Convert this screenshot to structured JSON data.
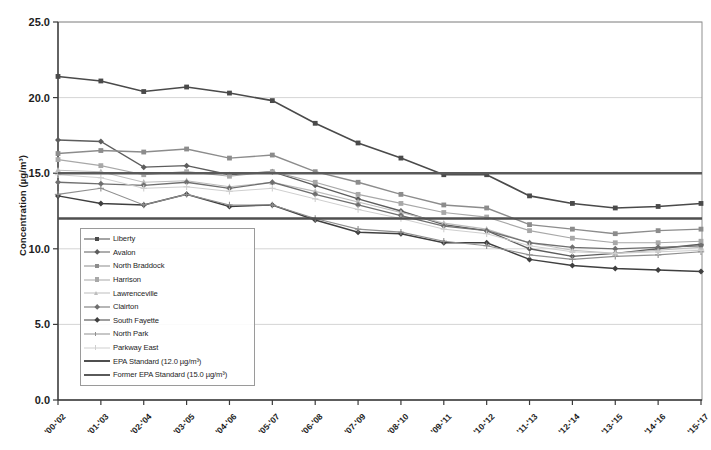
{
  "chart_data": {
    "type": "line",
    "title": "",
    "xlabel": "",
    "ylabel": "Concentration (µg/m³)",
    "ylim": [
      0.0,
      25.0
    ],
    "yticks": [
      "0.0",
      "5.0",
      "10.0",
      "15.0",
      "20.0",
      "25.0"
    ],
    "ytick_values": [
      0.0,
      5.0,
      10.0,
      15.0,
      20.0,
      25.0
    ],
    "grid": true,
    "legend_position": "inside-lower-left",
    "categories": [
      "'00-'02",
      "'01-'03",
      "'02-'04",
      "'03-'05",
      "'04-'06",
      "'05-'07",
      "'06-'08",
      "'07-'09",
      "'08-'10",
      "'09-'11",
      "'10-'12",
      "'11-'13",
      "'12-'14",
      "'13-'15",
      "'14-'16",
      "'15-'17"
    ],
    "series": [
      {
        "name": "Liberty",
        "color": "#4a4a4a",
        "marker": "square",
        "width": 1.6,
        "values": [
          21.4,
          21.1,
          20.4,
          20.7,
          20.3,
          19.8,
          18.3,
          17.0,
          16.0,
          14.9,
          14.9,
          13.5,
          13.0,
          12.7,
          12.8,
          13.0
        ]
      },
      {
        "name": "Avalon",
        "color": "#5d5d5d",
        "marker": "diamond",
        "width": 1.4,
        "values": [
          17.2,
          17.1,
          15.4,
          15.5,
          14.9,
          15.1,
          14.2,
          13.3,
          12.5,
          11.6,
          11.2,
          10.0,
          9.5,
          9.7,
          10.0,
          10.3
        ]
      },
      {
        "name": "North Braddock",
        "color": "#8c8c8c",
        "marker": "square",
        "width": 1.4,
        "values": [
          16.3,
          16.5,
          16.4,
          16.6,
          16.0,
          16.2,
          15.1,
          14.4,
          13.6,
          12.9,
          12.7,
          11.6,
          11.3,
          11.0,
          11.2,
          11.3
        ]
      },
      {
        "name": "Harrison",
        "color": "#a8a8a8",
        "marker": "square",
        "width": 1.2,
        "values": [
          15.9,
          15.5,
          14.9,
          15.1,
          14.8,
          15.1,
          14.4,
          13.6,
          13.0,
          12.4,
          12.1,
          11.2,
          10.7,
          10.4,
          10.4,
          10.5
        ]
      },
      {
        "name": "Lawrenceville",
        "color": "#bdbdbd",
        "marker": "triangle",
        "width": 1.1,
        "values": [
          15.2,
          15.1,
          14.4,
          14.5,
          14.1,
          14.4,
          13.8,
          13.1,
          12.4,
          11.7,
          11.3,
          10.4,
          9.9,
          9.7,
          9.9,
          10.1
        ]
      },
      {
        "name": "Clairton",
        "color": "#6f6f6f",
        "marker": "diamond",
        "width": 1.3,
        "values": [
          14.4,
          14.3,
          14.2,
          14.4,
          14.0,
          14.4,
          13.6,
          12.9,
          12.2,
          11.5,
          11.2,
          10.4,
          10.1,
          10.0,
          10.1,
          10.2
        ]
      },
      {
        "name": "South Fayette",
        "color": "#3f3f3f",
        "marker": "diamond",
        "width": 1.5,
        "values": [
          13.5,
          13.0,
          12.9,
          13.6,
          12.8,
          12.9,
          11.9,
          11.1,
          11.0,
          10.4,
          10.4,
          9.3,
          8.9,
          8.7,
          8.6,
          8.5
        ]
      },
      {
        "name": "North Park",
        "color": "#8f8f8f",
        "marker": "plus",
        "width": 1.1,
        "values": [
          13.6,
          14.0,
          12.9,
          13.6,
          12.9,
          12.9,
          12.0,
          11.3,
          11.1,
          10.5,
          10.2,
          9.6,
          9.3,
          9.5,
          9.6,
          9.8
        ]
      },
      {
        "name": "Parkway East",
        "color": "#cfcfcf",
        "marker": "plus",
        "width": 1.0,
        "values": [
          14.9,
          14.7,
          14.0,
          14.1,
          13.8,
          14.0,
          13.3,
          12.6,
          12.0,
          11.3,
          11.0,
          10.2,
          9.8,
          9.7,
          9.8,
          9.9
        ]
      }
    ],
    "reference_lines": [
      {
        "name": "EPA Standard (12.0 µg/m³)",
        "value": 12.0,
        "color": "#4f4f4f",
        "width": 2.6
      },
      {
        "name": "Former EPA Standard (15.0 µg/m³)",
        "value": 15.0,
        "color": "#5a5a5a",
        "width": 2.4
      }
    ]
  }
}
